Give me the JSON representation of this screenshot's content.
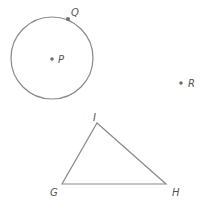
{
  "diagram": {
    "stroke_color": "#8a8a8a",
    "point_color": "#6f6f6f",
    "label_color": "#555555",
    "circle": {
      "center_label": "P",
      "cx": 52,
      "cy": 58,
      "r": 41
    },
    "points": [
      {
        "id": "P",
        "label": "P",
        "x": 52,
        "y": 59,
        "label_x": 58,
        "label_y": 63
      },
      {
        "id": "Q",
        "label": "Q",
        "x": 68,
        "y": 19,
        "label_x": 71,
        "label_y": 16
      },
      {
        "id": "R",
        "label": "R",
        "x": 181,
        "y": 83,
        "label_x": 188,
        "label_y": 87
      }
    ],
    "triangle": {
      "name": "GHI",
      "vertices": [
        {
          "id": "G",
          "label": "G",
          "x": 62,
          "y": 184,
          "label_x": 50,
          "label_y": 196
        },
        {
          "id": "H",
          "label": "H",
          "x": 166,
          "y": 184,
          "label_x": 172,
          "label_y": 196
        },
        {
          "id": "I",
          "label": "I",
          "x": 97,
          "y": 123,
          "label_x": 93,
          "label_y": 121
        }
      ]
    }
  }
}
